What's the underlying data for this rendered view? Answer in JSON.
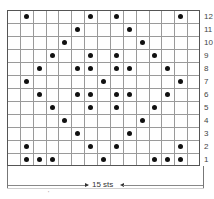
{
  "chart": {
    "title": "",
    "columns": 15,
    "rows": 12,
    "width_label": "15 sts",
    "row_labels": [
      "12",
      "11",
      "10",
      "9",
      "8",
      "7",
      "6",
      "5",
      "4",
      "3",
      "2",
      "1"
    ],
    "symbol": "dot",
    "dot_color": "#111111",
    "grid_color": "#9a9a9a",
    "pattern": {
      "12": [
        2,
        7,
        9,
        14
      ],
      "11": [
        6,
        10
      ],
      "10": [
        5,
        11
      ],
      "9": [
        4,
        7,
        9,
        12
      ],
      "8": [
        3,
        6,
        7,
        9,
        10,
        13
      ],
      "7": [
        2,
        8,
        14
      ],
      "6": [
        3,
        6,
        7,
        9,
        10,
        13
      ],
      "5": [
        4,
        7,
        9,
        12
      ],
      "4": [
        5,
        11
      ],
      "3": [
        6,
        10
      ],
      "2": [
        2,
        7,
        9,
        14
      ],
      "1": [
        2,
        3,
        4,
        8,
        12,
        13,
        14
      ]
    },
    "footnote_mark": "'"
  },
  "chart_data": {
    "type": "table",
    "xlabel": "15 sts",
    "ylabel": "Rows",
    "columns": 15,
    "rows": [
      1,
      2,
      3,
      4,
      5,
      6,
      7,
      8,
      9,
      10,
      11,
      12
    ],
    "cells_with_dots": {
      "1": [
        2,
        3,
        4,
        8,
        12,
        13,
        14
      ],
      "2": [
        2,
        7,
        9,
        14
      ],
      "3": [
        6,
        10
      ],
      "4": [
        5,
        11
      ],
      "5": [
        4,
        7,
        9,
        12
      ],
      "6": [
        3,
        6,
        7,
        9,
        10,
        13
      ],
      "7": [
        2,
        8,
        14
      ],
      "8": [
        3,
        6,
        7,
        9,
        10,
        13
      ],
      "9": [
        4,
        7,
        9,
        12
      ],
      "10": [
        5,
        11
      ],
      "11": [
        6,
        10
      ],
      "12": [
        2,
        7,
        9,
        14
      ]
    },
    "grid": true,
    "legend": "none"
  }
}
